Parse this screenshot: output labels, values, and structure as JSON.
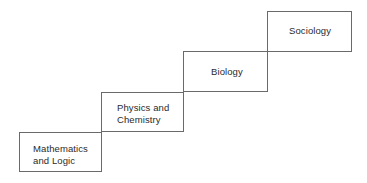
{
  "diagram": {
    "type": "staircase hierarchy",
    "steps": [
      {
        "label": "Mathematics\nand Logic"
      },
      {
        "label": "Physics and\nChemistry"
      },
      {
        "label": "Biology"
      },
      {
        "label": "Sociology"
      }
    ]
  }
}
